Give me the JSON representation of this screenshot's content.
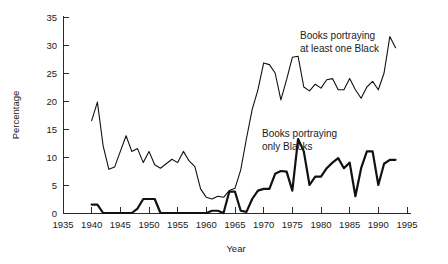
{
  "chart_data": {
    "type": "line",
    "title": "",
    "xlabel": "Year",
    "ylabel": "Percentage",
    "xlim": [
      1935,
      1996
    ],
    "ylim": [
      0,
      36
    ],
    "grid": false,
    "legend_position": "inline-annotation",
    "xticks": [
      1935,
      1940,
      1945,
      1950,
      1955,
      1960,
      1965,
      1970,
      1975,
      1980,
      1985,
      1990,
      1995
    ],
    "yticks": [
      0,
      5,
      10,
      15,
      20,
      25,
      30,
      35
    ],
    "annotations": [
      {
        "text_line1": "Books portraying",
        "text_line2": "at least one Black",
        "series": "at_least_one_black"
      },
      {
        "text_line1": "Books portraying",
        "text_line2": "only Blacks",
        "series": "only_blacks"
      }
    ],
    "x": [
      1940,
      1941,
      1942,
      1943,
      1944,
      1945,
      1946,
      1947,
      1948,
      1949,
      1950,
      1951,
      1952,
      1953,
      1954,
      1955,
      1956,
      1957,
      1958,
      1959,
      1960,
      1961,
      1962,
      1963,
      1964,
      1965,
      1966,
      1967,
      1968,
      1969,
      1970,
      1971,
      1972,
      1973,
      1974,
      1975,
      1976,
      1977,
      1978,
      1979,
      1980,
      1981,
      1982,
      1983,
      1984,
      1985,
      1986,
      1987,
      1988,
      1989,
      1990,
      1991,
      1992,
      1993
    ],
    "series": [
      {
        "name": "Books portraying at least one Black",
        "key": "at_least_one_black",
        "style": "thin",
        "values": [
          16.5,
          19.8,
          12.0,
          7.8,
          8.2,
          11.0,
          13.8,
          11.0,
          11.5,
          9.0,
          11.0,
          8.6,
          8.0,
          8.8,
          9.6,
          9.0,
          11.0,
          9.3,
          8.3,
          4.3,
          2.8,
          2.5,
          3.0,
          2.8,
          4.0,
          4.4,
          7.7,
          13.3,
          18.5,
          22.0,
          26.8,
          26.5,
          25.0,
          20.2,
          23.8,
          27.8,
          28.0,
          22.5,
          21.8,
          23.0,
          22.3,
          23.8,
          24.0,
          22.0,
          22.0,
          24.0,
          22.0,
          20.5,
          22.5,
          23.5,
          22.0,
          25.0,
          31.5,
          29.5
        ]
      },
      {
        "name": "Books portraying only Blacks",
        "key": "only_blacks",
        "style": "thick",
        "values": [
          1.5,
          1.5,
          0.0,
          0.0,
          0.0,
          0.0,
          0.0,
          0.0,
          0.8,
          2.5,
          2.5,
          2.5,
          0.0,
          0.0,
          0.0,
          0.0,
          0.0,
          0.0,
          0.0,
          0.0,
          0.0,
          0.4,
          0.4,
          0.0,
          3.8,
          3.8,
          0.4,
          0.2,
          2.5,
          4.0,
          4.3,
          4.3,
          7.0,
          7.5,
          7.4,
          4.0,
          13.2,
          11.0,
          5.0,
          6.5,
          6.5,
          8.0,
          9.0,
          9.8,
          8.0,
          9.0,
          3.0,
          8.0,
          11.0,
          11.0,
          5.0,
          8.8,
          9.5,
          9.5
        ]
      }
    ]
  }
}
